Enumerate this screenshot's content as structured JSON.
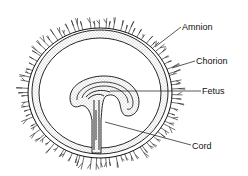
{
  "diagram": {
    "labels": {
      "amnion": "Amnion",
      "chorion": "Chorion",
      "fetus": "Fetus",
      "cord": "Cord"
    },
    "colors": {
      "ink": "#111111",
      "background": "#ffffff",
      "stipple": "#777777"
    }
  }
}
